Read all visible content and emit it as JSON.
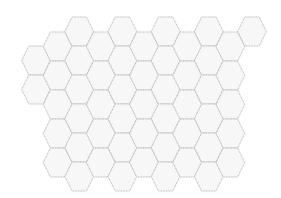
{
  "diagram": {
    "type": "hexagonal-grid",
    "orientation": "flat-top",
    "fill_color": "#f7f7f7",
    "stroke_color": "#b8b8b8",
    "stroke_width": 1,
    "hex_width": 28.8,
    "hex_height": 29,
    "column_spacing": 21.6,
    "row_spacing": 29,
    "origin_x": 36,
    "columns": [
      {
        "index": 0,
        "top_first": 46,
        "count": 2
      },
      {
        "index": 1,
        "top_first": 32,
        "count": 5
      },
      {
        "index": 2,
        "top_first": 17,
        "count": 6
      },
      {
        "index": 3,
        "top_first": 32,
        "count": 5
      },
      {
        "index": 4,
        "top_first": 17,
        "count": 6
      },
      {
        "index": 5,
        "top_first": 32,
        "count": 5
      },
      {
        "index": 6,
        "top_first": 17,
        "count": 6
      },
      {
        "index": 7,
        "top_first": 32,
        "count": 5
      },
      {
        "index": 8,
        "top_first": 17,
        "count": 6
      },
      {
        "index": 9,
        "top_first": 32,
        "count": 5
      },
      {
        "index": 10,
        "top_first": 17,
        "count": 1
      }
    ],
    "total_cells": 52
  }
}
